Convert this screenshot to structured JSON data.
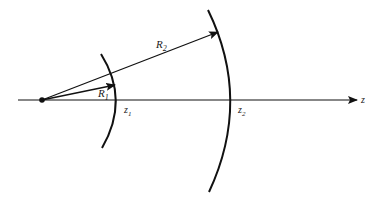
{
  "diagram": {
    "axis_label": "z",
    "radius_small_label": "R",
    "radius_small_sub": "1",
    "radius_large_label": "R",
    "radius_large_sub": "2",
    "z1_label": "z",
    "z1_sub": "1",
    "z2_label": "z",
    "z2_sub": "2",
    "colors": {
      "stroke": "#111111",
      "background": "#ffffff"
    }
  }
}
